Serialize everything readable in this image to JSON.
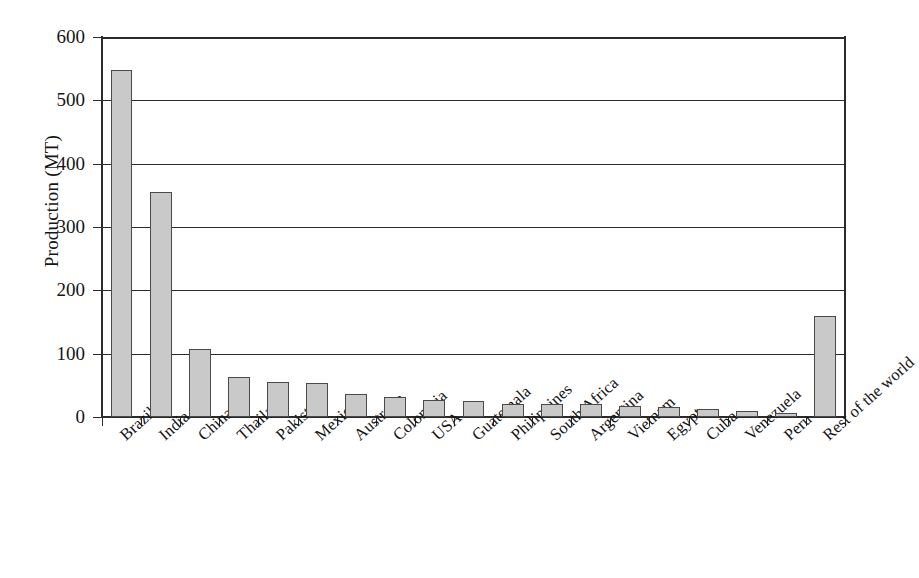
{
  "chart_data": {
    "type": "bar",
    "title": "",
    "xlabel": "",
    "ylabel": "Production (MT)",
    "ylim": [
      0,
      600
    ],
    "ytick_values": [
      0,
      100,
      200,
      300,
      400,
      500,
      600
    ],
    "ytick_labels": [
      "0",
      "100",
      "200",
      "300",
      "400",
      "500",
      "600"
    ],
    "grid": true,
    "grid_axis": "y",
    "legend": null,
    "bar_fill_color": "#c9c9c9",
    "bar_edge_color": "#4a4a4a",
    "categories": [
      "Brazil",
      "India",
      "China",
      "Thailand",
      "Pakistan",
      "Mexico",
      "Australia",
      "Colombia",
      "USA",
      "Guatemala",
      "Philippines",
      "South Africa",
      "Argentina",
      "Vietnam",
      "Egypt",
      "Cuba",
      "Venezuela",
      "Peru",
      "Rest of the world"
    ],
    "values": [
      548,
      356,
      107,
      63,
      55,
      54,
      37,
      31,
      27,
      25,
      21,
      20,
      20,
      18,
      16,
      12,
      10,
      7,
      160
    ]
  }
}
